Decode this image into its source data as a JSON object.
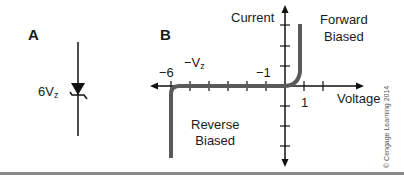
{
  "panel_a": {
    "label": "A",
    "component": "zener-diode",
    "rating_value": "6V",
    "rating_subscript": "z"
  },
  "panel_b": {
    "label": "B",
    "y_axis_label": "Current",
    "x_axis_label": "Voltage",
    "tick_neg6": "−6",
    "tick_neg1": "−1",
    "tick_pos1": "1",
    "vz_label_main": "−V",
    "vz_label_sub": "z",
    "region_forward": [
      "Forward",
      "Biased"
    ],
    "region_reverse": [
      "Reverse",
      "Biased"
    ]
  },
  "copyright": "© Cengage Learning 2014",
  "colors": {
    "curve": "#5a5a5a",
    "axis": "#111111",
    "divider": "#8a8a8a"
  }
}
